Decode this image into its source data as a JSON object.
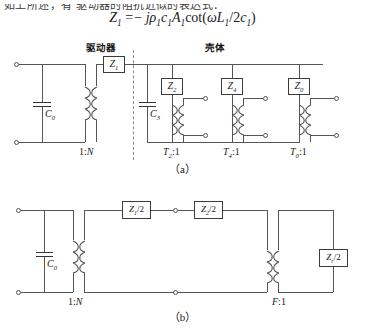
{
  "document": {
    "clipped_top_line": "如上所述，有 驱动器的阻抗近似的表达式：",
    "formula": {
      "lhs": "Z",
      "lhs_sub": "1",
      "equals": "= −",
      "rhs": "jρ",
      "rhs_parts": [
        "jρ",
        "1",
        "c",
        "1",
        "A",
        "1",
        "cot(",
        "ωL",
        "1",
        "/2c",
        "1",
        ")"
      ],
      "full": "Z₁ = − jρ₁c₁A₁cot(ωL₁/2c₁)"
    }
  },
  "figure_a": {
    "caption": "（a）",
    "region_labels": [
      {
        "text": "驱动器",
        "name": "driver-label"
      },
      {
        "text": "壳体",
        "name": "housing-label"
      }
    ],
    "capacitors": [
      {
        "label": "C",
        "sub": "0"
      },
      {
        "label": "C",
        "sub": "3"
      }
    ],
    "impedance_boxes": [
      {
        "label": "Z",
        "sub": "1"
      },
      {
        "label": "Z",
        "sub": "2"
      },
      {
        "label": "Z",
        "sub": "4"
      },
      {
        "label": "Z",
        "sub": "0"
      }
    ],
    "transformer_ratios": [
      {
        "text": "1:N",
        "pre": "1",
        "post": "N",
        "sub": ""
      },
      {
        "text": "T₂:1",
        "pre": "T",
        "sub": "2",
        "post": "1"
      },
      {
        "text": "T₄:1",
        "pre": "T",
        "sub": "4",
        "post": "1"
      },
      {
        "text": "T₀:1",
        "pre": "T",
        "sub": "0",
        "post": "1"
      }
    ]
  },
  "figure_b": {
    "caption": "（b）",
    "capacitors": [
      {
        "label": "C",
        "sub": "0"
      }
    ],
    "impedance_boxes": [
      {
        "label": "Z",
        "sub": "1",
        "div": "/2"
      },
      {
        "label": "Z",
        "sub": "2",
        "div": "/2"
      },
      {
        "label": "Z",
        "sub": "r",
        "div": "/2"
      }
    ],
    "transformer_ratios": [
      {
        "text": "1:N",
        "pre": "1",
        "post": "N"
      },
      {
        "text": "F:1",
        "pre": "F",
        "post": "1"
      }
    ]
  },
  "colors": {
    "wire": "#555555",
    "box_border": "#3b3b3b",
    "divider": "#888888",
    "text": "#1a1a1a"
  }
}
